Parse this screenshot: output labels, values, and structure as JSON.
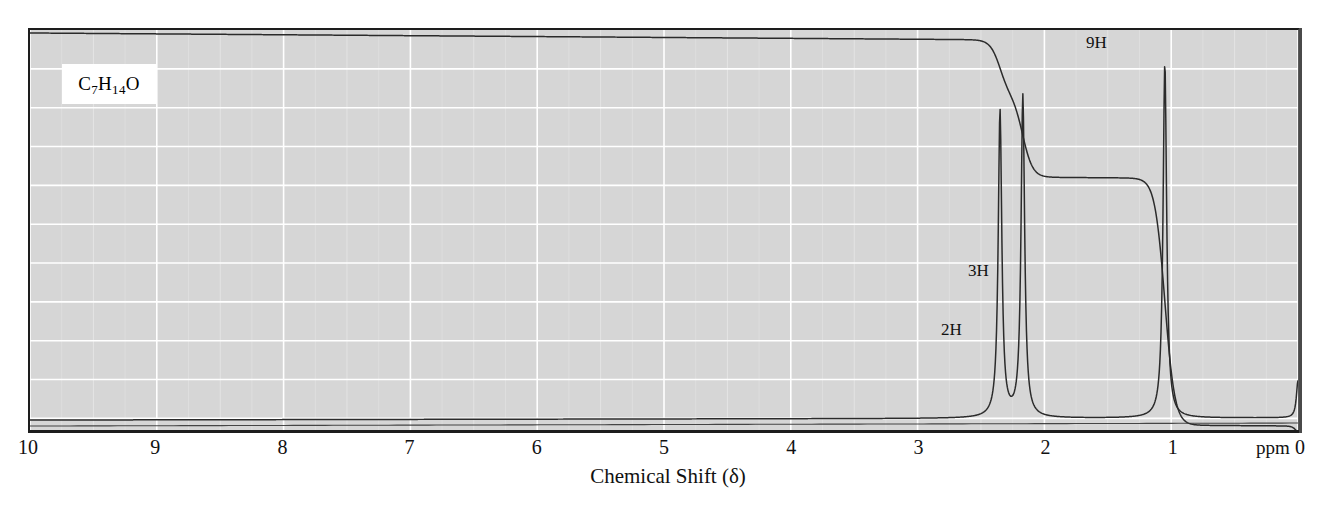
{
  "figure": {
    "kind": "nmr-spectrum",
    "formula_display": "C7H14O",
    "formula_parts": {
      "c": "C",
      "c_n": "7",
      "h": "H",
      "h_n": "14",
      "o": "O"
    },
    "ppm_unit_label": "ppm",
    "x_axis_title": "Chemical Shift (δ)",
    "colors": {
      "plot_background": "#d6d6d6",
      "gridline_major": "#ffffff",
      "gridline_minor": "#e4e4e4",
      "trace": "#2b2b2b",
      "frame_dark": "#1d1d1d",
      "frame_light": "#5b5b5b",
      "label_box_background": "#ffffff",
      "text": "#111111"
    }
  },
  "axis": {
    "ticks": [
      "10",
      "9",
      "8",
      "7",
      "6",
      "5",
      "4",
      "3",
      "2",
      "1",
      "0"
    ],
    "tick_values": [
      10,
      9,
      8,
      7,
      6,
      5,
      4,
      3,
      2,
      1,
      0
    ],
    "min": 0,
    "max": 10,
    "direction": "reversed",
    "minor_per_major": 2
  },
  "integration_labels": [
    {
      "id": "label-2H",
      "text": "2H",
      "ppm": 2.45
    },
    {
      "id": "label-3H",
      "text": "3H",
      "ppm": 2.25
    },
    {
      "id": "label-9H",
      "text": "9H",
      "ppm": 1.2
    }
  ],
  "chart_data": {
    "type": "line",
    "title": "",
    "subtitle": "",
    "xlabel": "Chemical Shift (δ)",
    "ylabel": "",
    "xlim": [
      10,
      0
    ],
    "ylim": [
      0,
      1
    ],
    "grid": true,
    "legend": "none",
    "annotations": [
      "C7H14O",
      "2H",
      "3H",
      "9H",
      "ppm"
    ],
    "series": [
      {
        "name": "spectrum",
        "description": "1H NMR absorption trace, baseline with sharp singlet/multiplet peaks",
        "peaks": [
          {
            "ppm": 2.35,
            "relative_height": 0.82,
            "assignment": "2H",
            "shape": "quartet-like"
          },
          {
            "ppm": 2.17,
            "relative_height": 0.86,
            "assignment": "3H",
            "shape": "singlet"
          },
          {
            "ppm": 1.05,
            "relative_height": 0.95,
            "assignment": "9H",
            "shape": "singlet"
          },
          {
            "ppm": 0.0,
            "relative_height": 0.1,
            "assignment": "TMS",
            "shape": "singlet"
          }
        ]
      },
      {
        "name": "integration",
        "description": "Stepped integral curve rising right to left across peaks",
        "steps": [
          {
            "ppm": 2.35,
            "protons": 2,
            "label": "2H"
          },
          {
            "ppm": 2.17,
            "protons": 3,
            "label": "3H"
          },
          {
            "ppm": 1.05,
            "protons": 9,
            "label": "9H"
          },
          {
            "ppm": 0.0,
            "protons": 0,
            "label": "TMS"
          }
        ],
        "total_protons": 14
      }
    ]
  }
}
